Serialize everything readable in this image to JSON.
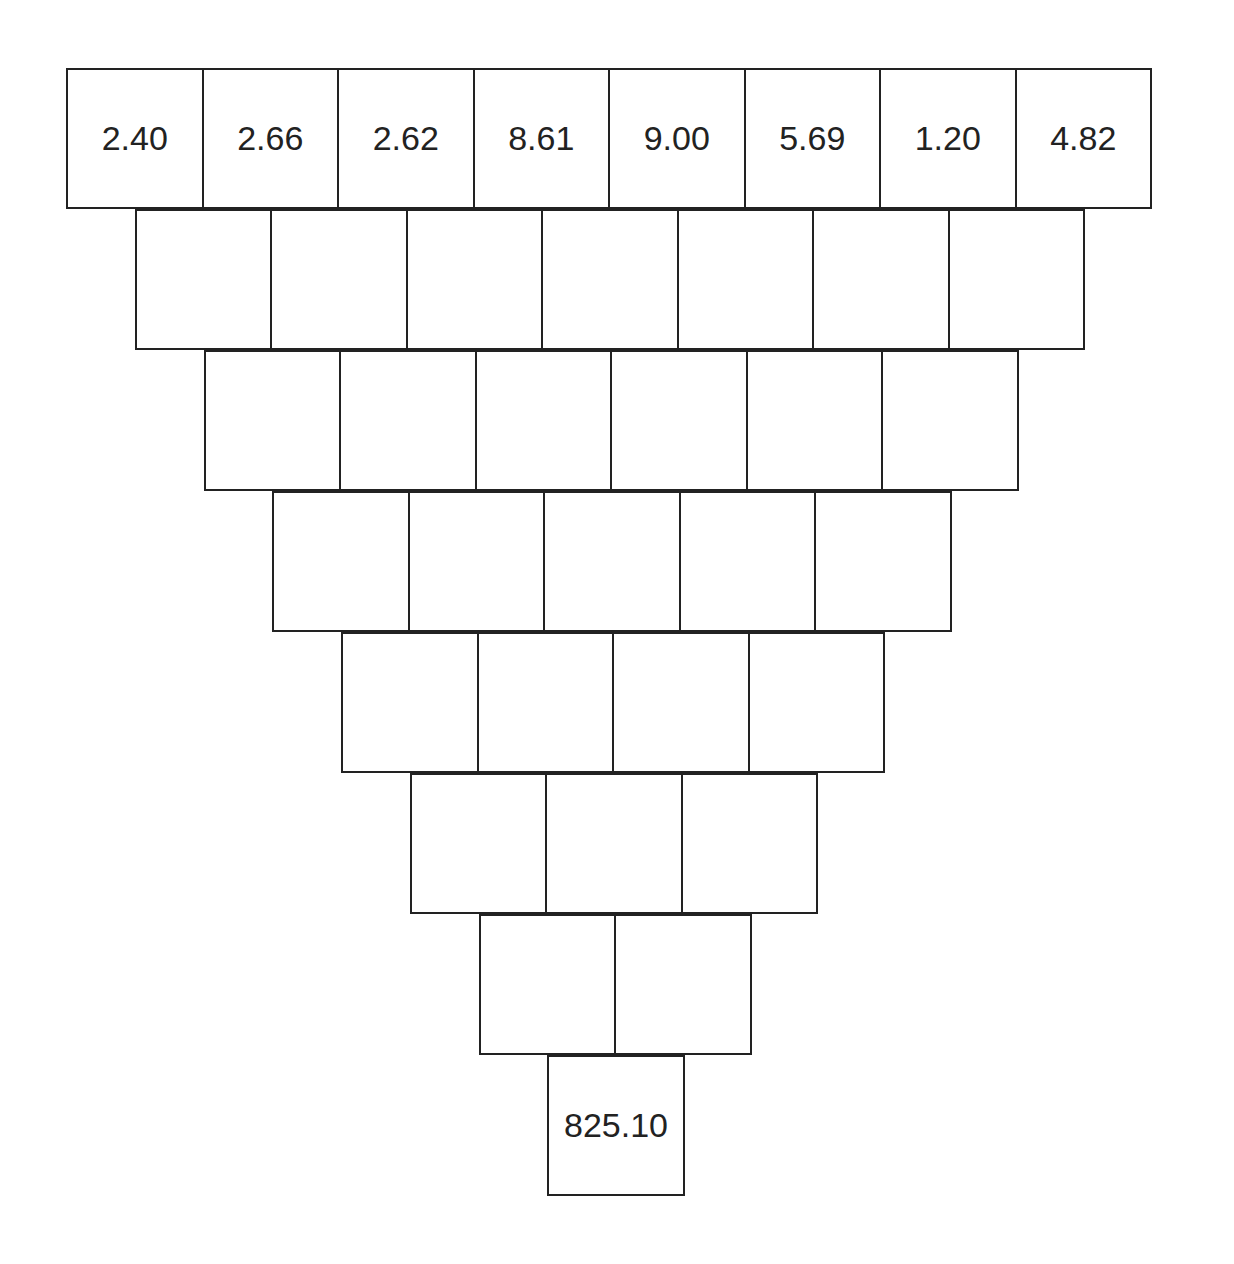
{
  "diagram": {
    "type": "inverted-number-pyramid",
    "title_fragment": "",
    "rows": [
      {
        "cells": [
          "2.40",
          "2.66",
          "2.62",
          "8.61",
          "9.00",
          "5.69",
          "1.20",
          "4.82"
        ]
      },
      {
        "cells": [
          "",
          "",
          "",
          "",
          "",
          "",
          ""
        ]
      },
      {
        "cells": [
          "",
          "",
          "",
          "",
          "",
          ""
        ]
      },
      {
        "cells": [
          "",
          "",
          "",
          "",
          ""
        ]
      },
      {
        "cells": [
          "",
          "",
          "",
          ""
        ]
      },
      {
        "cells": [
          "",
          "",
          ""
        ]
      },
      {
        "cells": [
          "",
          ""
        ]
      },
      {
        "cells": [
          "825.10"
        ]
      }
    ]
  }
}
